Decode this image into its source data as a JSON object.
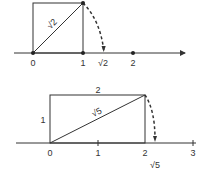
{
  "diagrams": [
    {
      "name": "sqrt2-construction",
      "axis_ticks": [
        "0",
        "1",
        "√2",
        "2"
      ],
      "diagonal_label": "√2",
      "shape": "unit square",
      "arc": "dashed arc from square corner to √2 on number line"
    },
    {
      "name": "sqrt5-construction",
      "axis_ticks": [
        "0",
        "1",
        "2",
        "3"
      ],
      "below_label": "√5",
      "diagonal_label": "√5",
      "side_top_label": "2",
      "side_left_label": "1",
      "shape": "1 by 2 rectangle",
      "arc": "dashed arc from rectangle corner to √5 on number line"
    }
  ],
  "colors": {
    "line": "#333333",
    "background": "#ffffff"
  }
}
